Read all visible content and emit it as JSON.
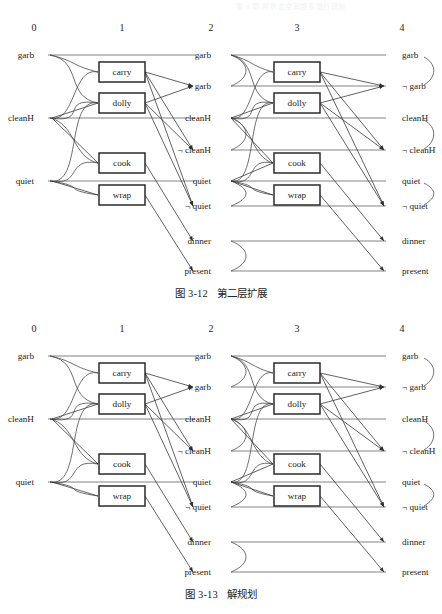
{
  "page": {
    "header_text": "第 3 章 用状态空间搜索进行规划",
    "width": 442,
    "height": 614,
    "background": "#ffffff",
    "ink_color": "#1d1d1d"
  },
  "figures": [
    {
      "id": "fig1",
      "caption_number": "图 3-12",
      "caption_text": "第二层扩展",
      "column_numbers": [
        "0",
        "1",
        "2",
        "3",
        "4"
      ],
      "level0_literals": [
        "garb",
        "cleanH",
        "quiet"
      ],
      "level1_actions": [
        "carry",
        "dolly",
        "cook",
        "wrap"
      ],
      "level2_literals": [
        "garb",
        "¬ garb",
        "cleanH",
        "¬ cleanH",
        "quiet",
        "¬ quiet",
        "dinner",
        "present"
      ],
      "level3_actions": [
        "carry",
        "dolly",
        "cook",
        "wrap"
      ],
      "level4_literals": [
        "garb",
        "¬ garb",
        "cleanH",
        "¬ cleanH",
        "quiet",
        "¬ quiet",
        "dinner",
        "present"
      ],
      "mutex_pairs": [
        [
          "garb",
          "¬ garb"
        ],
        [
          "cleanH",
          "¬ cleanH"
        ],
        [
          "quiet",
          "¬ quiet"
        ]
      ]
    },
    {
      "id": "fig2",
      "caption_number": "图 3-13",
      "caption_text": "解规划",
      "column_numbers": [
        "0",
        "1",
        "2",
        "3",
        "4"
      ],
      "level0_literals": [
        "garb",
        "cleanH",
        "quiet"
      ],
      "level1_actions": [
        "carry",
        "dolly",
        "cook",
        "wrap"
      ],
      "level2_literals": [
        "garb",
        "¬ garb",
        "cleanH",
        "¬ cleanH",
        "quiet",
        "¬ quiet",
        "dinner",
        "present"
      ],
      "level3_actions": [
        "carry",
        "dolly",
        "cook",
        "wrap"
      ],
      "level4_literals": [
        "garb",
        "¬ garb",
        "cleanH",
        "¬ cleanH",
        "quiet",
        "¬ quiet",
        "dinner",
        "present"
      ],
      "mutex_pairs": [
        [
          "garb",
          "¬ garb"
        ],
        [
          "cleanH",
          "¬ cleanH"
        ],
        [
          "quiet",
          "¬ quiet"
        ]
      ]
    }
  ],
  "geometry": {
    "col_x": [
      34,
      122,
      211,
      297,
      402
    ],
    "lit_y_left": [
      55,
      118,
      181
    ],
    "lit_y_full": [
      55,
      86,
      118,
      150,
      181,
      206,
      241,
      271
    ],
    "box_y": [
      62,
      93,
      153,
      185
    ],
    "box_w": 46,
    "box_h": 20
  },
  "colors": {
    "level_line": "#6e6e6e",
    "edge_line": "#3a3a3a",
    "box_stroke": "#2b2b2b",
    "box_fill": "#ffffff",
    "text": "#1d1d1d"
  }
}
